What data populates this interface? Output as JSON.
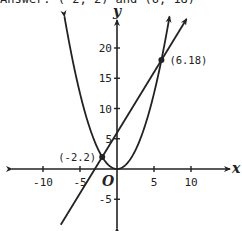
{
  "answer_text": "Answer: (-2, 2) and (6, 18)",
  "chart_data": {
    "type": "line",
    "title": "",
    "xlabel": "x",
    "ylabel": "y",
    "origin_label": "O",
    "xlim": [
      -14,
      15
    ],
    "ylim": [
      -10,
      26
    ],
    "x_ticks": [
      -10,
      -5,
      5,
      10
    ],
    "x_tick_labels": [
      "-10",
      "-5",
      "5",
      "10"
    ],
    "y_ticks": [
      -5,
      5,
      10,
      15,
      20
    ],
    "y_tick_labels": [
      "-5",
      "5",
      "10",
      "15",
      "20"
    ],
    "grid": false,
    "legend": null,
    "series": [
      {
        "name": "parabola y = x^2/2",
        "x_range": [
          -7.1,
          7.1
        ]
      },
      {
        "name": "line y = 2x + 6",
        "x_range": [
          -7.6,
          9.4
        ]
      }
    ],
    "points": [
      {
        "x": -2,
        "y": 2,
        "label": "(-2.2)"
      },
      {
        "x": 6,
        "y": 18,
        "label": "(6.18)"
      }
    ]
  }
}
